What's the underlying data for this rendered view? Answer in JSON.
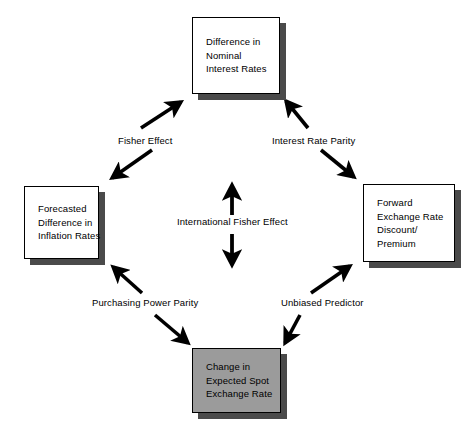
{
  "diagram": {
    "background_color": "#ffffff",
    "line_color": "#000000",
    "shadow_color": "#4a4a4a",
    "highlight_fill_color": "#9b9b9b",
    "nodes": [
      {
        "id": "nominal-interest-rates",
        "position": "top",
        "fill": "white",
        "lines": [
          "Difference in",
          "Nominal",
          "Interest Rates"
        ]
      },
      {
        "id": "inflation-rates",
        "position": "left",
        "fill": "white",
        "lines": [
          "Forecasted",
          "Difference in",
          "Inflation Rates"
        ]
      },
      {
        "id": "forward-rate",
        "position": "right",
        "fill": "white",
        "lines": [
          "Forward",
          "Exchange Rate",
          "Discount/",
          "Premium"
        ]
      },
      {
        "id": "expected-spot-rate",
        "position": "bottom",
        "fill": "gray",
        "lines": [
          "Change in",
          "Expected Spot",
          "Exchange Rate"
        ]
      }
    ],
    "edges": [
      {
        "id": "fisher-effect",
        "label": "Fisher Effect",
        "between": [
          "inflation-rates",
          "nominal-interest-rates"
        ],
        "direction": "bidirectional",
        "orientation": "diagonal-up-right"
      },
      {
        "id": "interest-rate-parity",
        "label": "Interest Rate Parity",
        "between": [
          "nominal-interest-rates",
          "forward-rate"
        ],
        "direction": "bidirectional",
        "orientation": "diagonal-down-right"
      },
      {
        "id": "international-fisher-effect",
        "label": "International Fisher Effect",
        "between": [
          "nominal-interest-rates",
          "expected-spot-rate"
        ],
        "direction": "bidirectional",
        "orientation": "vertical"
      },
      {
        "id": "purchasing-power-parity",
        "label": "Purchasing Power Parity",
        "between": [
          "inflation-rates",
          "expected-spot-rate"
        ],
        "direction": "bidirectional",
        "orientation": "diagonal-down-right"
      },
      {
        "id": "unbiased-predictor",
        "label": "Unbiased Predictor",
        "between": [
          "expected-spot-rate",
          "forward-rate"
        ],
        "direction": "bidirectional",
        "orientation": "diagonal-up-right"
      }
    ]
  }
}
